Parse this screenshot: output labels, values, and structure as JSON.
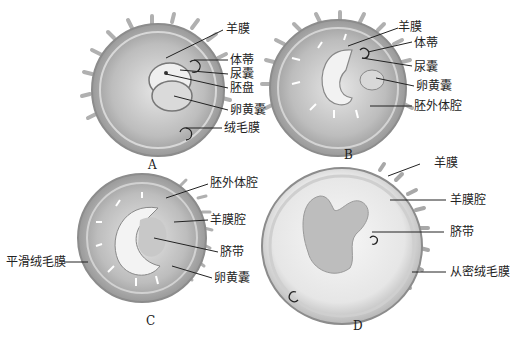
{
  "figure": {
    "panels": [
      {
        "id": "A",
        "caption": "A",
        "labels": [
          "羊膜",
          "体蒂",
          "尿囊",
          "胚盘",
          "卵黄囊",
          "绒毛膜"
        ]
      },
      {
        "id": "B",
        "caption": "B",
        "labels": [
          "羊膜",
          "体蒂",
          "尿囊",
          "卵黄囊",
          "胚外体腔"
        ]
      },
      {
        "id": "C",
        "caption": "C",
        "labels": [
          "胚外体腔",
          "羊膜腔",
          "脐带",
          "卵黄囊",
          "平滑绒毛膜"
        ]
      },
      {
        "id": "D",
        "caption": "D",
        "labels": [
          "羊膜",
          "羊膜腔",
          "脐带",
          "从密绒毛膜"
        ]
      }
    ]
  }
}
